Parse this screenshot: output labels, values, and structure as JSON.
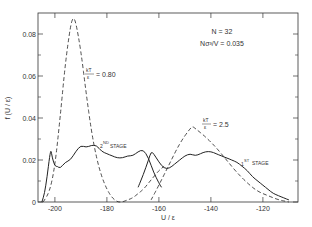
{
  "chart_data": {
    "type": "line",
    "title": "",
    "xlabel": "U / ε",
    "ylabel": "f (U / ε)",
    "xlim": [
      -206.5,
      -106.5
    ],
    "ylim": [
      0,
      0.09
    ],
    "x_ticks": [
      -200,
      -180,
      -160,
      -140,
      -120
    ],
    "x_tick_labels": [
      "-200",
      "-180",
      "-160",
      "-140",
      "-120"
    ],
    "y_ticks": [
      0,
      0.02,
      0.04,
      0.06,
      0.08
    ],
    "y_tick_labels": [
      "0",
      "0.02",
      "0.04",
      "0.06",
      "0.08"
    ],
    "grid": false,
    "annotations": {
      "n": "N = 32",
      "density": "Nσ³/V = 0.035",
      "kt_low_num": "kT",
      "kt_low_den": "ε",
      "kt_low_val": "= 0.80",
      "kt_high_num": "kT",
      "kt_high_den": "ε",
      "kt_high_val": "= 2.5",
      "stage2": "2ND STAGE",
      "stage2_base": "2",
      "stage2_sup": "ND",
      "stage2_word": "STAGE",
      "stage1_base": "1",
      "stage1_sup": "ST",
      "stage1_word": "STAGE"
    },
    "series": [
      {
        "name": "kT/ε = 0.80",
        "style": "dashed",
        "x": [
          -204.5,
          -202,
          -200,
          -198,
          -196,
          -194,
          -193,
          -192,
          -190,
          -188,
          -186,
          -184,
          -182,
          -180,
          -178,
          -176,
          -174,
          -172,
          -170,
          -168,
          -166,
          -164,
          -162,
          -160,
          -158
        ],
        "y": [
          0.0,
          0.005,
          0.017,
          0.04,
          0.066,
          0.084,
          0.088,
          0.086,
          0.072,
          0.052,
          0.034,
          0.021,
          0.012,
          0.006,
          0.002,
          0.0,
          0.0,
          0.001,
          0.002,
          0.004,
          0.006,
          0.009,
          0.012,
          0.015,
          0.017
        ]
      },
      {
        "name": "kT/ε = 2.5",
        "style": "dashed",
        "x": [
          -163,
          -160,
          -156,
          -152,
          -148,
          -147,
          -146,
          -142,
          -138,
          -134,
          -130,
          -126,
          -122,
          -118,
          -114,
          -110
        ],
        "y": [
          0.001,
          0.008,
          0.018,
          0.028,
          0.035,
          0.036,
          0.035,
          0.031,
          0.026,
          0.02,
          0.014,
          0.009,
          0.005,
          0.003,
          0.001,
          0.0
        ]
      },
      {
        "name": "2nd stage",
        "style": "solid",
        "x": [
          -205,
          -204,
          -203,
          -202,
          -201.5,
          -201,
          -200,
          -199,
          -198,
          -196,
          -194,
          -192,
          -190,
          -188,
          -186,
          -184,
          -182,
          -180,
          -178,
          -176,
          -174,
          -172,
          -170,
          -168,
          -166,
          -164,
          -162,
          -160,
          -159
        ],
        "y": [
          0.0,
          0.004,
          0.012,
          0.022,
          0.025,
          0.021,
          0.017,
          0.017,
          0.016,
          0.019,
          0.02,
          0.024,
          0.027,
          0.026,
          0.027,
          0.027,
          0.024,
          0.023,
          0.022,
          0.021,
          0.021,
          0.022,
          0.022,
          0.024,
          0.025,
          0.021,
          0.014,
          0.009,
          0.007
        ]
      },
      {
        "name": "1st stage",
        "style": "solid",
        "x": [
          -168,
          -166,
          -164,
          -163,
          -162,
          -160,
          -158,
          -156,
          -154,
          -152,
          -150,
          -148,
          -146,
          -144,
          -142,
          -140,
          -138,
          -136,
          -134,
          -132,
          -130,
          -128,
          -126,
          -124,
          -122,
          -120,
          -118,
          -116,
          -114,
          -112,
          -110
        ],
        "y": [
          0.007,
          0.013,
          0.02,
          0.024,
          0.023,
          0.019,
          0.016,
          0.016,
          0.018,
          0.02,
          0.022,
          0.023,
          0.022,
          0.023,
          0.024,
          0.024,
          0.023,
          0.022,
          0.021,
          0.02,
          0.019,
          0.017,
          0.015,
          0.012,
          0.01,
          0.008,
          0.006,
          0.004,
          0.003,
          0.002,
          0.001
        ]
      }
    ]
  }
}
